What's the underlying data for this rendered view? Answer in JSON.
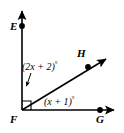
{
  "figure": {
    "type": "geometry-angle-diagram",
    "background_color": "#FFFFFF",
    "stroke_color": "#000000"
  },
  "points": [
    {
      "id": "E",
      "label": "E",
      "x": 22,
      "y": 26,
      "dot": true
    },
    {
      "id": "F",
      "label": "F",
      "x": 22,
      "y": 110,
      "dot": false
    },
    {
      "id": "G",
      "label": "G",
      "x": 100,
      "y": 110,
      "dot": true
    },
    {
      "id": "H",
      "label": "H",
      "x": 88,
      "y": 67,
      "dot": true
    }
  ],
  "rays": [
    {
      "id": "FE",
      "from": "F",
      "through": "E",
      "arrow_tip": {
        "x": 22,
        "y": 5
      }
    },
    {
      "id": "FG",
      "from": "F",
      "through": "G",
      "arrow_tip": {
        "x": 119,
        "y": 110
      }
    },
    {
      "id": "FH",
      "from": "F",
      "through": "H",
      "arrow_tip": {
        "x": 111,
        "y": 55
      }
    }
  ],
  "right_angle_mark": {
    "at": "F",
    "size": 9,
    "between": [
      "FE",
      "FG"
    ]
  },
  "angle_labels": {
    "upper": {
      "expression": "(2x + 2)",
      "degree_symbol": "°",
      "measures": "angle EFH",
      "leader_line": {
        "from_x": 29,
        "from_y": 74,
        "to_x": 26,
        "to_y": 88
      }
    },
    "lower": {
      "expression": "(x + 1)",
      "degree_symbol": "°",
      "measures": "angle HFG"
    }
  }
}
